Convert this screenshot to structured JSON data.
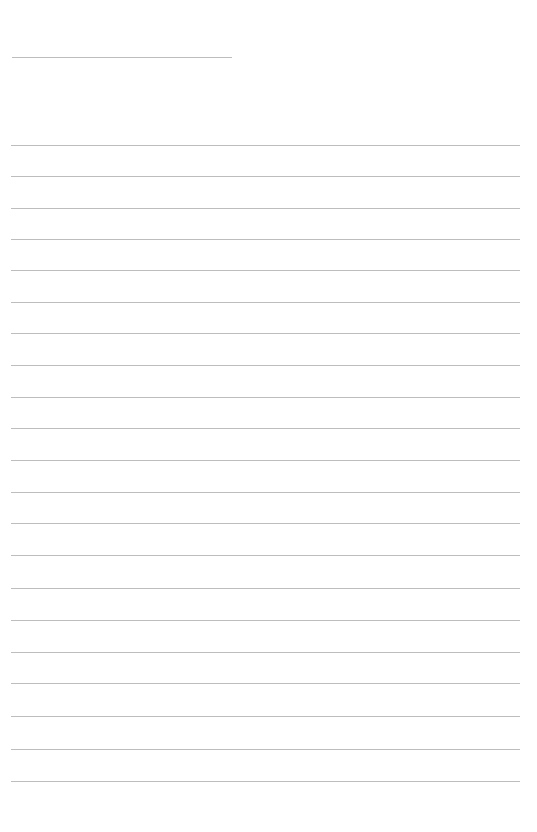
{
  "page": {
    "type": "blank lined paper",
    "background_color": "#ffffff",
    "line_color": "#bdbdbd"
  },
  "title_line": {
    "x": 12,
    "y": 57,
    "width": 220
  },
  "ruled_lines": {
    "count": 21,
    "x": 11,
    "width": 509,
    "first_y": 145,
    "spacing": 31.8,
    "positions": [
      145,
      176,
      208,
      239,
      270,
      302,
      333,
      365,
      397,
      428,
      460,
      492,
      523,
      555,
      588,
      620,
      652,
      683,
      716,
      749,
      781
    ]
  }
}
